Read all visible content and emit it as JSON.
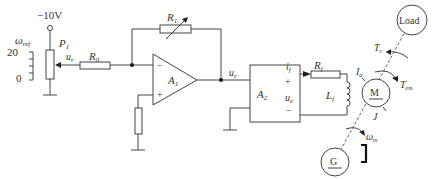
{
  "diagram": {
    "supply": {
      "label": "−10V"
    },
    "speed_scale": {
      "symbol": "ω",
      "subscript": "ref",
      "max": "20",
      "min": "0"
    },
    "potentiometer": {
      "label": "P",
      "subscript": "1"
    },
    "input_voltage": {
      "label": "u",
      "subscript": "r"
    },
    "input_resistor": {
      "label": "R",
      "subscript": "0"
    },
    "feedback_resistor": {
      "label": "R",
      "subscript": "1"
    },
    "opamp": {
      "label": "A",
      "subscript": "1",
      "minus": "−",
      "plus": "+"
    },
    "control_voltage": {
      "label": "u",
      "subscript": "c"
    },
    "amplifier": {
      "label": "A",
      "subscript": "2"
    },
    "field_current": {
      "label": "i",
      "subscript": "f"
    },
    "field_voltage": {
      "label": "u",
      "subscript": "e",
      "plus": "+",
      "minus": "−"
    },
    "field_resistor": {
      "label": "R",
      "subscript": "f"
    },
    "field_inductor": {
      "label": "L",
      "subscript": "f"
    },
    "motor": {
      "label": "M"
    },
    "armature_current": {
      "label": "I",
      "subscript": "a"
    },
    "motor_torque": {
      "label": "T",
      "subscript": "em"
    },
    "load_torque": {
      "label": "T",
      "subscript": "c"
    },
    "inertia": {
      "label": "J"
    },
    "load": {
      "label": "Load"
    },
    "angular_speed": {
      "symbol": "ω",
      "subscript": "m"
    },
    "generator": {
      "label": "G"
    }
  }
}
